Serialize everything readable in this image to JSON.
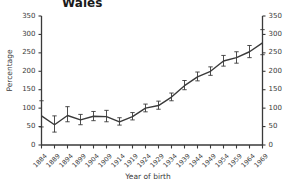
{
  "chart_data": {
    "type": "line",
    "title": "Wales",
    "xlabel": "Year of birth",
    "ylabel": "Percentage",
    "ylim": [
      0,
      350
    ],
    "yticks": [
      0,
      50,
      100,
      150,
      200,
      250,
      300,
      350
    ],
    "right_axis": true,
    "right_yticks": [
      0,
      50,
      100,
      150,
      200,
      250,
      300,
      350
    ],
    "grid": false,
    "legend": null,
    "categories": [
      "1884",
      "1889",
      "1894",
      "1899",
      "1904",
      "1909",
      "1914",
      "1919",
      "1924",
      "1929",
      "1934",
      "1939",
      "1944",
      "1949",
      "1954",
      "1959",
      "1964",
      "1969"
    ],
    "series": [
      {
        "name": "Percentage",
        "values": [
          79,
          55,
          80,
          68,
          78,
          77,
          63,
          77,
          100,
          107,
          130,
          161,
          185,
          200,
          228,
          237,
          253,
          277
        ],
        "error_low": [
          49,
          35,
          63,
          55,
          66,
          63,
          54,
          68,
          90,
          97,
          120,
          150,
          174,
          189,
          214,
          222,
          237,
          245
        ],
        "error_high": [
          120,
          79,
          104,
          83,
          91,
          94,
          74,
          88,
          111,
          119,
          141,
          175,
          198,
          212,
          243,
          253,
          270,
          313
        ],
        "color": "#3a3a3a"
      }
    ]
  }
}
